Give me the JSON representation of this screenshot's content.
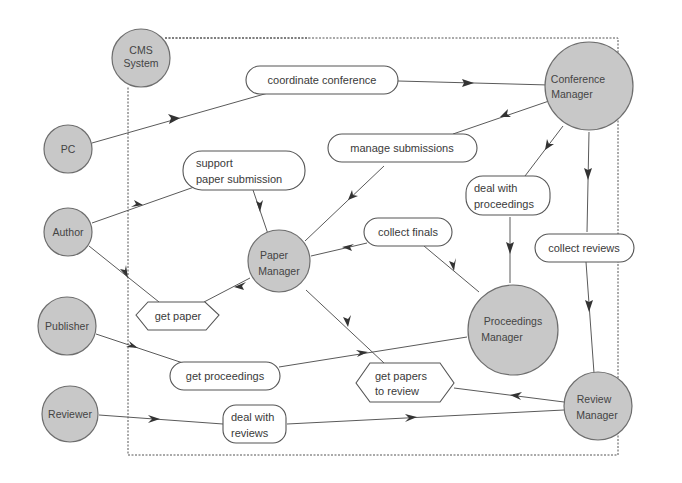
{
  "diagram": {
    "boundary_label": "CMS System",
    "external_agents": [
      {
        "id": "cms",
        "label_lines": [
          "CMS",
          "System"
        ]
      },
      {
        "id": "pc",
        "label_lines": [
          "PC"
        ]
      },
      {
        "id": "author",
        "label_lines": [
          "Author"
        ]
      },
      {
        "id": "publisher",
        "label_lines": [
          "Publisher"
        ]
      },
      {
        "id": "reviewer",
        "label_lines": [
          "Reviewer"
        ]
      }
    ],
    "internal_agents": [
      {
        "id": "conference_manager",
        "label_lines": [
          "Conference",
          "Manager"
        ]
      },
      {
        "id": "paper_manager",
        "label_lines": [
          "Paper",
          "Manager"
        ]
      },
      {
        "id": "proceedings_manager",
        "label_lines": [
          "Proceedings",
          "Manager"
        ]
      },
      {
        "id": "review_manager",
        "label_lines": [
          "Review",
          "Manager"
        ]
      }
    ],
    "goals": [
      {
        "id": "coordinate_conference",
        "shape": "rounded",
        "label_lines": [
          "coordinate conference"
        ]
      },
      {
        "id": "manage_submissions",
        "shape": "rounded",
        "label_lines": [
          "manage submissions"
        ]
      },
      {
        "id": "support_paper_submission",
        "shape": "rounded",
        "label_lines": [
          "support",
          "paper submission"
        ]
      },
      {
        "id": "deal_with_proceedings",
        "shape": "rounded",
        "label_lines": [
          "deal with",
          "proceedings"
        ]
      },
      {
        "id": "collect_finals",
        "shape": "rounded",
        "label_lines": [
          "collect finals"
        ]
      },
      {
        "id": "collect_reviews",
        "shape": "rounded",
        "label_lines": [
          "collect reviews"
        ]
      },
      {
        "id": "get_paper",
        "shape": "hexagon",
        "label_lines": [
          "get paper"
        ]
      },
      {
        "id": "get_proceedings",
        "shape": "rounded",
        "label_lines": [
          "get proceedings"
        ]
      },
      {
        "id": "get_papers_to_review",
        "shape": "hexagon",
        "label_lines": [
          "get papers",
          "to review"
        ]
      },
      {
        "id": "deal_with_reviews",
        "shape": "rounded",
        "label_lines": [
          "deal with",
          "reviews"
        ]
      }
    ],
    "edges": [
      {
        "from": "pc",
        "to": "coordinate_conference"
      },
      {
        "from": "coordinate_conference",
        "to": "conference_manager"
      },
      {
        "from": "conference_manager",
        "to": "manage_submissions"
      },
      {
        "from": "manage_submissions",
        "to": "paper_manager"
      },
      {
        "from": "conference_manager",
        "to": "deal_with_proceedings"
      },
      {
        "from": "deal_with_proceedings",
        "to": "proceedings_manager"
      },
      {
        "from": "conference_manager",
        "to": "collect_reviews"
      },
      {
        "from": "collect_reviews",
        "to": "review_manager"
      },
      {
        "from": "author",
        "to": "support_paper_submission"
      },
      {
        "from": "support_paper_submission",
        "to": "paper_manager"
      },
      {
        "from": "proceedings_manager",
        "to": "collect_finals"
      },
      {
        "from": "collect_finals",
        "to": "paper_manager"
      },
      {
        "from": "paper_manager",
        "to": "get_paper"
      },
      {
        "from": "get_paper",
        "to": "author"
      },
      {
        "from": "publisher",
        "to": "get_proceedings"
      },
      {
        "from": "get_proceedings",
        "to": "proceedings_manager"
      },
      {
        "from": "review_manager",
        "to": "get_papers_to_review"
      },
      {
        "from": "get_papers_to_review",
        "to": "paper_manager"
      },
      {
        "from": "reviewer",
        "to": "deal_with_reviews"
      },
      {
        "from": "deal_with_reviews",
        "to": "review_manager"
      }
    ]
  }
}
